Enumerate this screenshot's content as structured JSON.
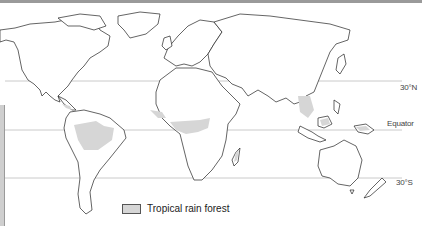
{
  "map": {
    "title": "Tropical rain forest distribution",
    "latitude_lines": [
      {
        "label": "30°N",
        "y": 81
      },
      {
        "label": "Equator",
        "y": 130
      },
      {
        "label": "30°S",
        "y": 178
      }
    ],
    "legend": {
      "label": "Tropical rain forest",
      "swatch_color": "#d6d6d6"
    },
    "colors": {
      "coastline": "#222222",
      "land": "#ffffff",
      "rainforest": "#d6d6d6",
      "grid": "#bdbdbd"
    }
  }
}
